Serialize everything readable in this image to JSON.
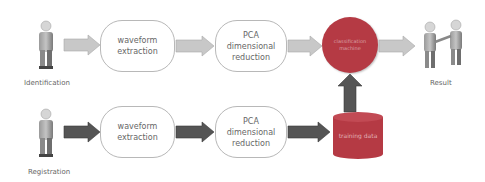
{
  "diagram": {
    "rows": [
      {
        "name": "identification",
        "actor_label": "Identification",
        "steps": [
          "waveform extraction",
          "PCA dimensional reduction"
        ],
        "arrow_color": "#c8c8c8"
      },
      {
        "name": "registration",
        "actor_label": "Registration",
        "steps": [
          "waveform extraction",
          "PCA dimensional reduction"
        ],
        "arrow_color": "#555555"
      }
    ],
    "classifier": {
      "label": "classification machine",
      "color": "#b53a44"
    },
    "training_data": {
      "label": "training data",
      "color": "#b53a44"
    },
    "result": {
      "label": "Result"
    },
    "colors": {
      "light_arrow": "#c8c8c8",
      "dark_arrow": "#555555",
      "box_border": "#b8b8b8",
      "accent_red": "#b53a44"
    }
  }
}
